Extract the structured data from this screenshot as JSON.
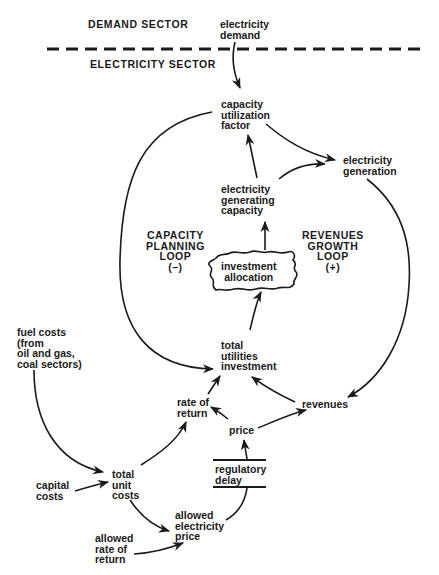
{
  "sectors": {
    "demand": "DEMAND SECTOR",
    "electricity": "ELECTRICITY SECTOR"
  },
  "nodes": {
    "electricity_demand": "electricity\ndemand",
    "capacity_utilization_factor": "capacity\nutilization\nfactor",
    "electricity_generation": "electricity\ngeneration",
    "electricity_generating_capacity": "electricity\ngenerating\ncapacity",
    "investment_allocation": "investment\nallocation",
    "total_utilities_investment": "total\nutilities\ninvestment",
    "fuel_costs": "fuel costs\n(from\noil and gas,\ncoal sectors)",
    "rate_of_return": "rate of\nreturn",
    "revenues": "revenues",
    "price": "price",
    "regulatory_delay": "regulatory\ndelay",
    "capital_costs": "capital\ncosts",
    "total_unit_costs": "total\nunit\ncosts",
    "allowed_electricity_price": "allowed\nelectricity\nprice",
    "allowed_rate_of_return": "allowed\nrate of\nreturn"
  },
  "loops": {
    "capacity_planning": "CAPACITY\nPLANNING\nLOOP\n(–)",
    "revenues_growth": "REVENUES\nGROWTH\nLOOP\n(+)"
  },
  "colors": {
    "ink": "#1a1a1a",
    "background": "#ffffff"
  }
}
